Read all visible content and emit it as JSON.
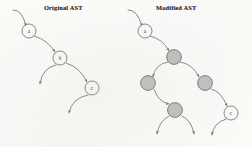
{
  "figure": {
    "background_color": "#fdfdfb",
    "stroke_color": "#4a4a4a",
    "shaded_node_fill": "#b9b9b9",
    "plain_node_fill": "#ffffff"
  },
  "panels": [
    {
      "id": "original",
      "title": "Original AST",
      "title_x": 44,
      "title_y": 4,
      "nodes": [
        {
          "label": "a",
          "x": 29,
          "y": 31,
          "r": 7.0,
          "shaded": false
        },
        {
          "label": "b",
          "x": 60,
          "y": 58,
          "r": 7.0,
          "shaded": false
        },
        {
          "label": "c",
          "x": 92,
          "y": 88,
          "r": 7.0,
          "shaded": false
        }
      ],
      "edges": [
        {
          "from": [
            13,
            10
          ],
          "to": [
            26,
            26
          ],
          "ctrl": [
            22,
            9
          ],
          "arrow": true
        },
        {
          "from": [
            34,
            36
          ],
          "to": [
            55,
            52
          ],
          "ctrl": [
            48,
            40
          ],
          "arrow": true
        },
        {
          "from": [
            56,
            65
          ],
          "to": [
            40,
            84
          ],
          "ctrl": [
            42,
            68
          ],
          "arrow": true
        },
        {
          "from": [
            66,
            63
          ],
          "to": [
            87,
            82
          ],
          "ctrl": [
            80,
            67
          ],
          "arrow": true
        },
        {
          "from": [
            88,
            95
          ],
          "to": [
            69,
            113
          ],
          "ctrl": [
            72,
            98
          ],
          "arrow": true
        }
      ]
    },
    {
      "id": "modified",
      "title": "Modified AST",
      "title_x": 156,
      "title_y": 4,
      "nodes": [
        {
          "label": "a",
          "x": 145,
          "y": 31,
          "r": 7.0,
          "shaded": false
        },
        {
          "label": "",
          "x": 174,
          "y": 57,
          "r": 7.4,
          "shaded": true
        },
        {
          "label": "",
          "x": 148,
          "y": 83,
          "r": 7.4,
          "shaded": true
        },
        {
          "label": "",
          "x": 205,
          "y": 83,
          "r": 7.4,
          "shaded": true
        },
        {
          "label": "",
          "x": 175,
          "y": 110,
          "r": 7.4,
          "shaded": true
        },
        {
          "label": "c",
          "x": 231,
          "y": 113,
          "r": 7.0,
          "shaded": false
        }
      ],
      "edges": [
        {
          "from": [
            128,
            10
          ],
          "to": [
            142,
            26
          ],
          "ctrl": [
            137,
            9
          ],
          "arrow": true
        },
        {
          "from": [
            150,
            36
          ],
          "to": [
            169,
            51
          ],
          "ctrl": [
            163,
            39
          ],
          "arrow": true
        },
        {
          "from": [
            168,
            62
          ],
          "to": [
            153,
            77
          ],
          "ctrl": [
            155,
            64
          ],
          "arrow": true
        },
        {
          "from": [
            180,
            62
          ],
          "to": [
            199,
            77
          ],
          "ctrl": [
            193,
            64
          ],
          "arrow": true
        },
        {
          "from": [
            154,
            89
          ],
          "to": [
            169,
            104
          ],
          "ctrl": [
            158,
            102
          ],
          "arrow": true
        },
        {
          "from": [
            169,
            116
          ],
          "to": [
            157,
            134
          ],
          "ctrl": [
            159,
            121
          ],
          "arrow": true
        },
        {
          "from": [
            182,
            116
          ],
          "to": [
            194,
            134
          ],
          "ctrl": [
            192,
            121
          ],
          "arrow": true
        },
        {
          "from": [
            211,
            89
          ],
          "to": [
            227,
            106
          ],
          "ctrl": [
            221,
            91
          ],
          "arrow": true
        },
        {
          "from": [
            226,
            119
          ],
          "to": [
            212,
            135
          ],
          "ctrl": [
            213,
            123
          ],
          "arrow": true
        }
      ]
    }
  ]
}
